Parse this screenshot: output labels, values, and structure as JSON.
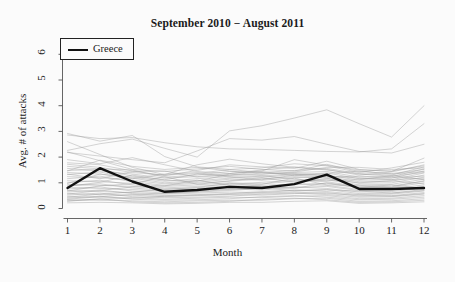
{
  "chart_data": {
    "type": "line",
    "title": "September 2010 − August 2011",
    "xlabel": "Month",
    "ylabel": "Avg. # of attacks",
    "xlim": [
      1,
      12
    ],
    "ylim": [
      0,
      6.4
    ],
    "xticks": [
      "1",
      "2",
      "3",
      "4",
      "5",
      "6",
      "7",
      "8",
      "9",
      "10",
      "11",
      "12"
    ],
    "yticks": [
      "0",
      "1",
      "2",
      "3",
      "4",
      "5",
      "6"
    ],
    "grid": false,
    "legend": {
      "position": "top-left",
      "entries": [
        {
          "label": "Greece",
          "color": "#111111",
          "width": 2.4
        }
      ]
    },
    "x": [
      1,
      2,
      3,
      4,
      5,
      6,
      7,
      8,
      9,
      10,
      11,
      12
    ],
    "highlight_series": {
      "name": "Greece",
      "color": "#111111",
      "values": [
        0.8,
        1.57,
        1.05,
        0.65,
        0.72,
        0.84,
        0.8,
        0.95,
        1.32,
        0.76,
        0.76,
        0.8
      ]
    },
    "background_series": [
      {
        "name": "bg-01",
        "values": [
          2.92,
          2.62,
          2.84,
          2.02,
          1.62,
          1.52,
          1.4,
          1.34,
          1.26,
          1.18,
          1.12,
          1.18
        ]
      },
      {
        "name": "bg-02",
        "values": [
          2.86,
          2.72,
          2.76,
          2.56,
          2.4,
          2.32,
          2.3,
          2.26,
          2.22,
          2.2,
          2.32,
          3.3
        ]
      },
      {
        "name": "bg-03",
        "values": [
          2.26,
          2.52,
          2.7,
          2.34,
          2.0,
          3.02,
          3.22,
          3.52,
          3.84,
          3.3,
          2.78,
          4.0
        ]
      },
      {
        "name": "bg-04",
        "values": [
          2.18,
          2.04,
          1.9,
          1.78,
          2.24,
          2.72,
          2.66,
          2.8,
          2.5,
          2.22,
          2.16,
          2.5
        ]
      },
      {
        "name": "bg-05",
        "values": [
          1.78,
          1.7,
          1.46,
          1.28,
          1.48,
          1.7,
          1.62,
          1.56,
          1.84,
          1.52,
          1.44,
          1.96
        ]
      },
      {
        "name": "bg-06",
        "values": [
          1.72,
          1.6,
          1.4,
          1.3,
          1.36,
          1.52,
          1.58,
          1.74,
          1.66,
          1.4,
          1.58,
          1.8
        ]
      },
      {
        "name": "bg-07",
        "values": [
          1.64,
          1.54,
          1.5,
          1.22,
          1.3,
          1.44,
          1.4,
          1.48,
          1.56,
          1.36,
          1.3,
          1.62
        ]
      },
      {
        "name": "bg-08",
        "values": [
          1.56,
          1.46,
          1.34,
          1.18,
          1.24,
          1.36,
          1.5,
          1.62,
          1.52,
          1.3,
          1.42,
          1.7
        ]
      },
      {
        "name": "bg-09",
        "values": [
          1.48,
          1.52,
          1.26,
          1.12,
          1.34,
          1.28,
          1.34,
          1.4,
          1.44,
          1.22,
          1.24,
          1.54
        ]
      },
      {
        "name": "bg-10",
        "values": [
          1.4,
          1.34,
          1.22,
          1.06,
          1.16,
          1.24,
          1.22,
          1.32,
          1.38,
          1.16,
          1.18,
          1.46
        ]
      },
      {
        "name": "bg-11",
        "values": [
          1.32,
          1.42,
          1.18,
          1.0,
          1.08,
          1.18,
          1.26,
          1.36,
          1.3,
          1.1,
          1.12,
          1.38
        ]
      },
      {
        "name": "bg-12",
        "values": [
          1.24,
          1.2,
          1.1,
          0.96,
          1.02,
          1.14,
          1.1,
          1.2,
          1.24,
          1.04,
          1.06,
          1.3
        ]
      },
      {
        "name": "bg-13",
        "values": [
          1.16,
          1.26,
          1.04,
          0.9,
          0.98,
          1.06,
          1.16,
          1.24,
          1.18,
          0.98,
          1.0,
          1.22
        ]
      },
      {
        "name": "bg-14",
        "values": [
          1.08,
          1.04,
          0.98,
          0.86,
          0.92,
          1.0,
          0.96,
          1.06,
          1.12,
          0.92,
          0.94,
          1.14
        ]
      },
      {
        "name": "bg-15",
        "values": [
          1.0,
          1.1,
          0.92,
          0.8,
          0.86,
          0.94,
          1.02,
          1.1,
          1.04,
          0.86,
          0.88,
          1.06
        ]
      },
      {
        "name": "bg-16",
        "values": [
          0.94,
          0.9,
          0.86,
          0.76,
          0.8,
          0.88,
          0.84,
          0.94,
          0.98,
          0.8,
          0.82,
          1.0
        ]
      },
      {
        "name": "bg-17",
        "values": [
          0.88,
          0.96,
          0.8,
          0.7,
          0.76,
          0.82,
          0.9,
          0.96,
          0.9,
          0.74,
          0.76,
          0.92
        ]
      },
      {
        "name": "bg-18",
        "values": [
          0.82,
          0.78,
          0.74,
          0.66,
          0.7,
          0.76,
          0.72,
          0.82,
          0.86,
          0.7,
          0.72,
          0.86
        ]
      },
      {
        "name": "bg-19",
        "values": [
          0.76,
          0.84,
          0.68,
          0.6,
          0.64,
          0.7,
          0.78,
          0.84,
          0.78,
          0.64,
          0.66,
          0.8
        ]
      },
      {
        "name": "bg-20",
        "values": [
          0.7,
          0.66,
          0.62,
          0.56,
          0.6,
          0.64,
          0.62,
          0.7,
          0.74,
          0.58,
          0.6,
          0.74
        ]
      },
      {
        "name": "bg-21",
        "values": [
          0.64,
          0.72,
          0.58,
          0.5,
          0.54,
          0.58,
          0.66,
          0.72,
          0.66,
          0.54,
          0.56,
          0.68
        ]
      },
      {
        "name": "bg-22",
        "values": [
          0.58,
          0.54,
          0.52,
          0.46,
          0.5,
          0.54,
          0.52,
          0.58,
          0.62,
          0.48,
          0.5,
          0.62
        ]
      },
      {
        "name": "bg-23",
        "values": [
          0.52,
          0.6,
          0.46,
          0.42,
          0.44,
          0.48,
          0.56,
          0.6,
          0.54,
          0.44,
          0.46,
          0.56
        ]
      },
      {
        "name": "bg-24",
        "values": [
          0.46,
          0.44,
          0.42,
          0.36,
          0.4,
          0.44,
          0.42,
          0.48,
          0.5,
          0.38,
          0.4,
          0.5
        ]
      },
      {
        "name": "bg-25",
        "values": [
          0.4,
          0.48,
          0.36,
          0.32,
          0.34,
          0.38,
          0.46,
          0.5,
          0.44,
          0.34,
          0.36,
          0.44
        ]
      },
      {
        "name": "bg-26",
        "values": [
          0.34,
          0.32,
          0.3,
          0.26,
          0.3,
          0.32,
          0.32,
          0.38,
          0.4,
          0.28,
          0.3,
          0.38
        ]
      },
      {
        "name": "bg-27",
        "values": [
          0.28,
          0.38,
          0.26,
          0.22,
          0.24,
          0.28,
          0.36,
          0.4,
          0.34,
          0.24,
          0.26,
          0.32
        ]
      },
      {
        "name": "bg-28",
        "values": [
          0.22,
          0.24,
          0.22,
          0.18,
          0.2,
          0.24,
          0.24,
          0.28,
          0.3,
          0.2,
          0.22,
          0.26
        ]
      },
      {
        "name": "bg-29",
        "values": [
          2.6,
          2.1,
          1.6,
          1.32,
          1.7,
          1.92,
          1.74,
          1.6,
          1.5,
          1.34,
          1.26,
          1.4
        ]
      },
      {
        "name": "bg-30",
        "values": [
          2.2,
          1.86,
          1.52,
          1.44,
          1.54,
          1.64,
          1.52,
          1.46,
          1.72,
          1.44,
          1.36,
          1.52
        ]
      },
      {
        "name": "bg-31",
        "values": [
          1.9,
          1.74,
          1.98,
          1.7,
          1.44,
          1.36,
          1.46,
          1.9,
          1.68,
          1.5,
          1.46,
          1.66
        ]
      },
      {
        "name": "bg-32",
        "values": [
          1.46,
          1.88,
          1.64,
          1.52,
          1.6,
          1.46,
          1.34,
          1.42,
          1.6,
          1.6,
          1.52,
          1.58
        ]
      },
      {
        "name": "bg-33",
        "values": [
          1.34,
          1.16,
          1.44,
          1.46,
          1.22,
          1.3,
          1.44,
          1.28,
          1.36,
          1.46,
          1.34,
          1.44
        ]
      },
      {
        "name": "bg-34",
        "values": [
          0.98,
          1.34,
          1.16,
          1.34,
          1.4,
          1.22,
          1.12,
          1.3,
          1.22,
          1.26,
          1.2,
          1.26
        ]
      },
      {
        "name": "bg-35",
        "values": [
          0.86,
          1.02,
          1.3,
          1.1,
          1.06,
          1.34,
          1.28,
          1.14,
          1.08,
          1.12,
          1.28,
          1.12
        ]
      },
      {
        "name": "bg-36",
        "values": [
          0.68,
          0.88,
          0.96,
          1.24,
          0.94,
          1.08,
          1.2,
          1.02,
          1.16,
          1.0,
          1.08,
          0.96
        ]
      },
      {
        "name": "bg-37",
        "values": [
          0.56,
          0.7,
          0.84,
          0.88,
          1.1,
          0.9,
          0.94,
          1.18,
          0.92,
          0.9,
          0.84,
          1.08
        ]
      },
      {
        "name": "bg-38",
        "values": [
          0.44,
          0.56,
          0.64,
          0.74,
          0.82,
          0.98,
          0.86,
          0.78,
          1.0,
          0.82,
          0.92,
          0.78
        ]
      },
      {
        "name": "bg-39",
        "values": [
          0.36,
          0.46,
          0.54,
          0.58,
          0.66,
          0.74,
          0.82,
          0.68,
          0.72,
          0.68,
          0.6,
          0.7
        ]
      },
      {
        "name": "bg-40",
        "values": [
          0.3,
          0.36,
          0.4,
          0.48,
          0.52,
          0.56,
          0.6,
          0.64,
          0.58,
          0.52,
          0.48,
          0.58
        ]
      }
    ]
  },
  "legend": {
    "greece_label": "Greece"
  }
}
